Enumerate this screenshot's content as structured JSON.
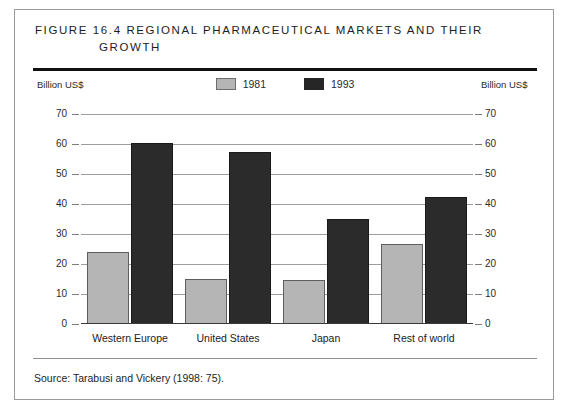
{
  "figure": {
    "title_line1": "Figure 16.4  Regional Pharmaceutical Markets and Their",
    "title_line2": "Growth",
    "source": "Source:  Tarabusi and Vickery (1998: 75).",
    "axis_caption_left": "Billion US$",
    "axis_caption_right": "Billion US$"
  },
  "legend": {
    "items": [
      {
        "label": "1981",
        "color": "#b5b5b5",
        "style": "gray"
      },
      {
        "label": "1993",
        "color": "#2b2b2b",
        "style": "black"
      }
    ]
  },
  "chart_data": {
    "type": "bar",
    "xlabel": "",
    "ylabel": "Billion US$",
    "ylim": [
      0,
      70
    ],
    "yticks": [
      0,
      10,
      20,
      30,
      40,
      50,
      60,
      70
    ],
    "ytick_labels": [
      "0",
      "10",
      "20",
      "30",
      "40",
      "50",
      "60",
      "70"
    ],
    "grid": true,
    "grid_axis": "y",
    "legend_position": "top-center",
    "dual_y_axis": true,
    "categories": [
      "Western Europe",
      "United States",
      "Japan",
      "Rest of world"
    ],
    "series": [
      {
        "name": "1981",
        "color": "#b5b5b5",
        "values": [
          24,
          15,
          14.7,
          26.7
        ]
      },
      {
        "name": "1993",
        "color": "#2b2b2b",
        "values": [
          60.5,
          57.5,
          35,
          42.5
        ]
      }
    ],
    "source": "Tarabusi and Vickery (1998: 75)."
  }
}
